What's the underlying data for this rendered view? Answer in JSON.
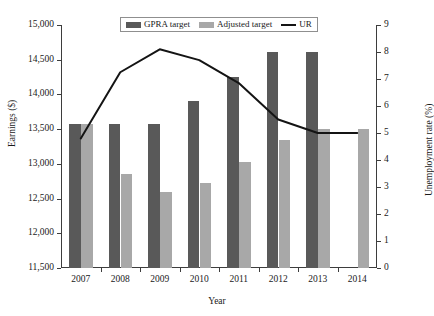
{
  "chart_data": {
    "type": "bar",
    "title": "",
    "subtitle": "",
    "xlabel": "Year",
    "ylabel": "Earnings ($)",
    "y2label": "Unemployment rate (%)",
    "categories": [
      "2007",
      "2008",
      "2009",
      "2010",
      "2011",
      "2012",
      "2013",
      "2014"
    ],
    "ylim": [
      11500,
      15000
    ],
    "ytick_step": 500,
    "yticks": [
      11500,
      12000,
      12500,
      13000,
      13500,
      14000,
      14500,
      15000
    ],
    "ytick_labels": [
      "11,500",
      "12,000",
      "12,500",
      "13,000",
      "13,500",
      "14,000",
      "14,500",
      "15,000"
    ],
    "y2lim": [
      0,
      9
    ],
    "y2tick_step": 1,
    "y2ticks": [
      0,
      1,
      2,
      3,
      4,
      5,
      6,
      7,
      8,
      9
    ],
    "y2tick_labels": [
      "0",
      "1",
      "2",
      "3",
      "4",
      "5",
      "6",
      "7",
      "8",
      "9"
    ],
    "grid": false,
    "legend_position": "top-center",
    "series": [
      {
        "name": "GPRA target",
        "kind": "bar",
        "axis": "left",
        "color": "#595959",
        "values": [
          13570,
          13570,
          13570,
          13905,
          14250,
          14610,
          14610,
          null
        ]
      },
      {
        "name": "Adjusted target",
        "kind": "bar",
        "axis": "left",
        "color": "#a8a8a8",
        "values": [
          13570,
          12855,
          12595,
          12730,
          13020,
          13350,
          13505,
          13500
        ]
      },
      {
        "name": "UR",
        "kind": "line",
        "axis": "right",
        "color": "#141414",
        "values": [
          4.8,
          7.25,
          8.1,
          7.7,
          6.85,
          5.5,
          5.0,
          5.0
        ]
      }
    ],
    "annotations": []
  },
  "legend": {
    "entries": [
      {
        "label": "GPRA target",
        "marker": "bar-swatch",
        "color": "#595959"
      },
      {
        "label": "Adjusted target",
        "marker": "bar-swatch",
        "color": "#a8a8a8"
      },
      {
        "label": "UR",
        "marker": "line-swatch",
        "color": "#141414"
      }
    ]
  },
  "top_artifact": {
    "text": "·"
  }
}
